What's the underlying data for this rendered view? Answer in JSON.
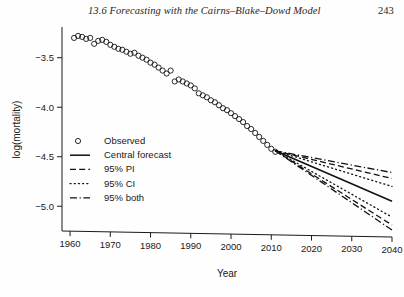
{
  "page": {
    "running_head": "13.6  Forecasting with the Cairns–Blake–Dowd Model",
    "folio": "243"
  },
  "chart_data": {
    "type": "scatter",
    "title": "",
    "xlabel": "Year",
    "ylabel": "log(mortality)",
    "xlim": [
      1958,
      2040
    ],
    "ylim": [
      -5.25,
      -3.2
    ],
    "xticks": [
      1960,
      1970,
      1980,
      1990,
      2000,
      2010,
      2020,
      2030,
      2040
    ],
    "xticklabels": [
      "1960",
      "1970",
      "1980",
      "1990",
      "2000",
      "2010",
      "2020",
      "2030",
      "2040"
    ],
    "yticks": [
      -3.5,
      -4.0,
      -4.5,
      -5.0
    ],
    "yticklabels": [
      "−3.5",
      "−4.0",
      "−4.5",
      "−5.0"
    ],
    "grid": false,
    "legend_position": "lower-left-inside",
    "legend": [
      {
        "label": "Observed",
        "marker": "open-circle",
        "style": "marker"
      },
      {
        "label": "Central forecast",
        "marker": "none",
        "style": "solid"
      },
      {
        "label": "95% PI",
        "marker": "none",
        "style": "dashed"
      },
      {
        "label": "95% CI",
        "marker": "none",
        "style": "dotted"
      },
      {
        "label": "95% both",
        "marker": "none",
        "style": "dash-dot"
      }
    ],
    "forecast_origin_year": 2011,
    "forecast_origin_value": -4.44,
    "series": [
      {
        "name": "Observed",
        "style": "marker",
        "x": [
          1961,
          1962,
          1963,
          1964,
          1965,
          1966,
          1967,
          1968,
          1969,
          1970,
          1971,
          1972,
          1973,
          1974,
          1975,
          1976,
          1977,
          1978,
          1979,
          1980,
          1981,
          1982,
          1983,
          1984,
          1985,
          1986,
          1987,
          1988,
          1989,
          1990,
          1991,
          1992,
          1993,
          1994,
          1995,
          1996,
          1997,
          1998,
          1999,
          2000,
          2001,
          2002,
          2003,
          2004,
          2005,
          2006,
          2007,
          2008,
          2009,
          2010,
          2011
        ],
        "y": [
          -3.3,
          -3.28,
          -3.29,
          -3.31,
          -3.3,
          -3.36,
          -3.33,
          -3.32,
          -3.34,
          -3.37,
          -3.39,
          -3.41,
          -3.42,
          -3.44,
          -3.46,
          -3.45,
          -3.48,
          -3.5,
          -3.52,
          -3.55,
          -3.57,
          -3.6,
          -3.63,
          -3.66,
          -3.63,
          -3.74,
          -3.72,
          -3.74,
          -3.76,
          -3.78,
          -3.81,
          -3.86,
          -3.88,
          -3.9,
          -3.93,
          -3.95,
          -3.98,
          -4.01,
          -4.03,
          -4.06,
          -4.09,
          -4.12,
          -4.15,
          -4.19,
          -4.22,
          -4.26,
          -4.3,
          -4.34,
          -4.38,
          -4.42,
          -4.45
        ]
      },
      {
        "name": "Central forecast",
        "style": "solid",
        "x": [
          2011,
          2040
        ],
        "y": [
          -4.44,
          -4.95
        ]
      },
      {
        "name": "95% PI upper",
        "style": "dashed",
        "x": [
          2011,
          2040
        ],
        "y": [
          -4.44,
          -4.72
        ]
      },
      {
        "name": "95% PI lower",
        "style": "dashed",
        "x": [
          2011,
          2040
        ],
        "y": [
          -4.44,
          -5.19
        ]
      },
      {
        "name": "95% CI upper",
        "style": "dotted",
        "x": [
          2011,
          2040
        ],
        "y": [
          -4.44,
          -4.8
        ]
      },
      {
        "name": "95% CI lower",
        "style": "dotted",
        "x": [
          2011,
          2040
        ],
        "y": [
          -4.44,
          -5.11
        ]
      },
      {
        "name": "95% both upper",
        "style": "dash-dot",
        "x": [
          2011,
          2040
        ],
        "y": [
          -4.44,
          -4.66
        ]
      },
      {
        "name": "95% both lower",
        "style": "dash-dot",
        "x": [
          2011,
          2040
        ],
        "y": [
          -4.44,
          -5.24
        ]
      }
    ]
  }
}
